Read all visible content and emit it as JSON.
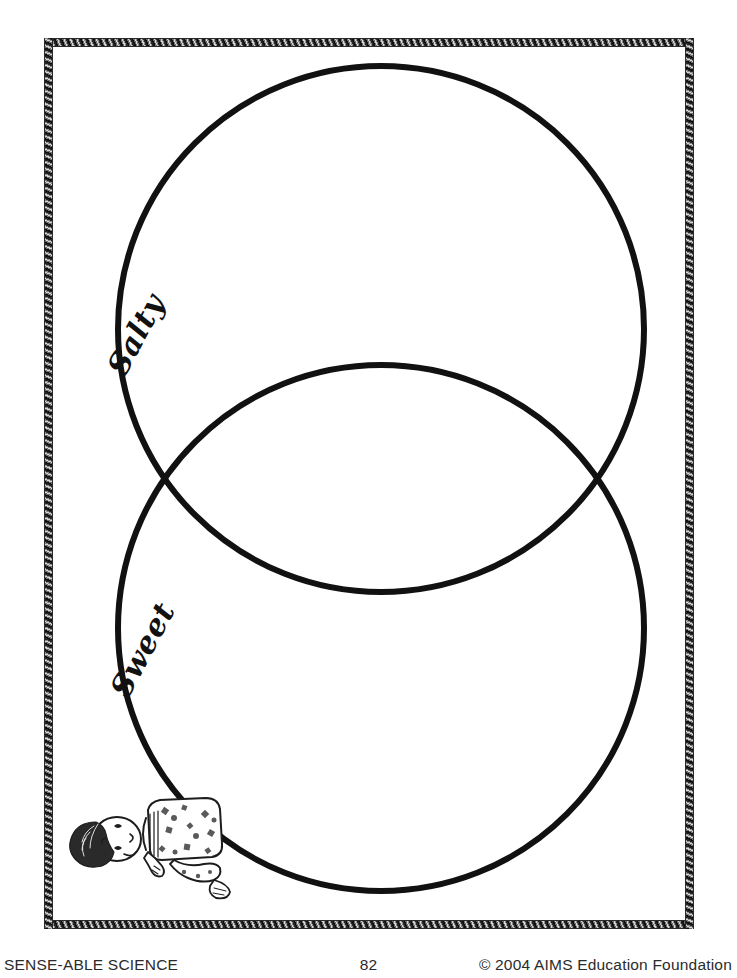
{
  "page": {
    "kind": "printable-worksheet",
    "background_color": "#ffffff",
    "ink_color": "#111111",
    "width": 737,
    "height": 978
  },
  "frame": {
    "style_name": "braided-rope-border",
    "left": 44,
    "top": 38,
    "width": 650,
    "height": 891
  },
  "chart_data": {
    "type": "venn",
    "title": "",
    "grid": false,
    "legend": "none",
    "sets": [
      {
        "name": "Salty",
        "label": "Salty",
        "label_rotation_deg": -62,
        "center": [
          381,
          329
        ],
        "radius": 263,
        "stroke": "#111111",
        "stroke_width": 6,
        "fill": "none",
        "items": []
      },
      {
        "name": "Sweet",
        "label": "Sweet",
        "label_rotation_deg": -62,
        "center": [
          381,
          628
        ],
        "radius": 263,
        "stroke": "#111111",
        "stroke_width": 6,
        "fill": "none",
        "items": []
      }
    ],
    "intersection": {
      "label": "",
      "items": [],
      "left_crossing": [
        173,
        482
      ],
      "right_crossing": [
        589,
        482
      ]
    },
    "xlabel": "",
    "ylabel": ""
  },
  "labels": {
    "salty": "Salty",
    "sweet": "Sweet"
  },
  "illustration": {
    "name": "child-lying-down-illustration",
    "description": "Line-art drawing of a reclining child with dark hair wearing a patterned shirt",
    "alt": "child lying down"
  },
  "footer": {
    "left": "SENSE-ABLE SCIENCE",
    "page_number": "82",
    "right": "© 2004 AIMS Education Foundation"
  }
}
